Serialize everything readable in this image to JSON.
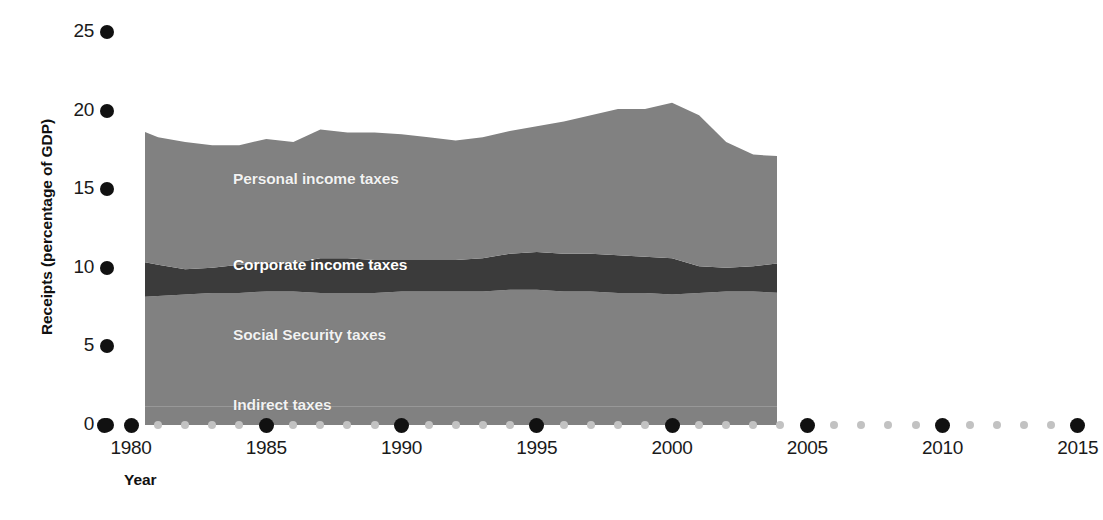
{
  "chart_data": {
    "type": "area",
    "title": "",
    "xlabel": "Year",
    "ylabel": "Receipts (percentage of GDP)",
    "stacked": true,
    "grid": false,
    "legend_position": "inline-on-bands",
    "xlim": [
      1979,
      2015
    ],
    "ylim": [
      0,
      25
    ],
    "x_ticks": [
      1980,
      1985,
      1990,
      1995,
      2000,
      2005,
      2010,
      2015
    ],
    "y_ticks": [
      0,
      5,
      10,
      15,
      20,
      25
    ],
    "x_minor_step": 1,
    "x": [
      1979,
      1980,
      1981,
      1982,
      1983,
      1984,
      1985,
      1986,
      1987,
      1988,
      1989,
      1990,
      1991,
      1992,
      1993,
      1994,
      1995,
      1996,
      1997,
      1998,
      1999,
      2000,
      2001,
      2002,
      2003,
      2004,
      2005,
      2006,
      2007,
      2008,
      2009,
      2010,
      2011
    ],
    "series": [
      {
        "name": "Indirect taxes",
        "color": "#818181",
        "values": [
          1.2,
          1.2,
          1.2,
          1.2,
          1.2,
          1.2,
          1.2,
          1.2,
          1.2,
          1.2,
          1.2,
          1.2,
          1.2,
          1.2,
          1.2,
          1.2,
          1.2,
          1.2,
          1.2,
          1.2,
          1.2,
          1.2,
          1.2,
          1.2,
          1.2,
          1.2,
          1.2,
          1.2,
          1.2,
          1.2,
          1.2,
          1.2,
          1.2
        ]
      },
      {
        "name": "Social Security taxes",
        "color": "#818181",
        "values": [
          6.8,
          6.9,
          7.0,
          7.1,
          7.2,
          7.2,
          7.3,
          7.3,
          7.2,
          7.2,
          7.2,
          7.3,
          7.3,
          7.3,
          7.3,
          7.4,
          7.4,
          7.3,
          7.3,
          7.2,
          7.2,
          7.1,
          7.2,
          7.3,
          7.3,
          7.2,
          7.2,
          7.1,
          7.1,
          7.1,
          7.3,
          7.3,
          7.3
        ]
      },
      {
        "name": "Corporate income taxes",
        "color": "#3b3b3b",
        "values": [
          2.5,
          2.4,
          2.0,
          1.6,
          1.6,
          1.8,
          1.8,
          1.8,
          2.2,
          2.2,
          2.1,
          2.0,
          2.0,
          2.0,
          2.1,
          2.3,
          2.4,
          2.4,
          2.4,
          2.4,
          2.3,
          2.3,
          1.7,
          1.5,
          1.6,
          1.9,
          2.5,
          2.7,
          2.7,
          2.1,
          1.2,
          1.5,
          1.6
        ]
      },
      {
        "name": "Personal income taxes",
        "color": "#818181",
        "values": [
          8.7,
          8.5,
          8.1,
          8.1,
          7.8,
          7.6,
          7.9,
          7.7,
          8.2,
          8.0,
          8.1,
          8.0,
          7.8,
          7.6,
          7.7,
          7.8,
          8.0,
          8.4,
          8.8,
          9.3,
          9.4,
          9.9,
          9.6,
          8.0,
          7.1,
          6.8,
          7.4,
          7.8,
          8.3,
          7.8,
          6.4,
          6.1,
          7.9
        ]
      }
    ],
    "series_labels": [
      {
        "name": "Personal income taxes",
        "x_px": 233,
        "y_px": 170,
        "on_dark": false
      },
      {
        "name": "Corporate income taxes",
        "x_px": 233,
        "y_px": 256,
        "on_dark": true
      },
      {
        "name": "Social Security taxes",
        "x_px": 233,
        "y_px": 326,
        "on_dark": false
      },
      {
        "name": "Indirect taxes",
        "x_px": 233,
        "y_px": 396,
        "on_dark": false
      }
    ],
    "colors": {
      "light_band": "#818181",
      "dark_band": "#3b3b3b",
      "axis_dot_major": "#111111",
      "axis_dot_minor": "#c2c2c2",
      "label_text": "#f2f2f2",
      "background": "#ffffff"
    }
  }
}
